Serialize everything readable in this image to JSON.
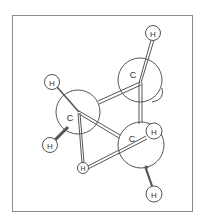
{
  "diagram": {
    "type": "ball-and-stick molecular model",
    "atoms": [
      {
        "id": "H1",
        "element": "H",
        "label": "H",
        "x": 153,
        "y": 33,
        "r": 7.5
      },
      {
        "id": "C1",
        "element": "C",
        "label": "C",
        "x": 140,
        "y": 80,
        "r": 22,
        "label_x": 133,
        "label_y": 77
      },
      {
        "id": "C2",
        "element": "C",
        "label": "C",
        "x": 78,
        "y": 112,
        "r": 22,
        "label_x": 70,
        "label_y": 121
      },
      {
        "id": "C3",
        "element": "C",
        "label": "C",
        "x": 141,
        "y": 145,
        "r": 23,
        "label_x": 132,
        "label_y": 141
      },
      {
        "id": "H2",
        "element": "H",
        "label": "H",
        "x": 52,
        "y": 82,
        "r": 7.5
      },
      {
        "id": "H3",
        "element": "H",
        "label": "H",
        "x": 50,
        "y": 145,
        "r": 7.5
      },
      {
        "id": "H4",
        "element": "H",
        "label": "H",
        "x": 83,
        "y": 168,
        "r": 5.5
      },
      {
        "id": "H5",
        "element": "H",
        "label": "H",
        "x": 154,
        "y": 131,
        "r": 8
      },
      {
        "id": "H6",
        "element": "H",
        "label": "H",
        "x": 154,
        "y": 194,
        "r": 8
      }
    ],
    "bonds": [
      {
        "from": "C1",
        "to": "H1"
      },
      {
        "from": "C1",
        "to": "C2"
      },
      {
        "from": "C1",
        "to": "C3"
      },
      {
        "from": "C2",
        "to": "C3"
      },
      {
        "from": "C2",
        "to": "H2"
      },
      {
        "from": "C2",
        "to": "H3"
      },
      {
        "from": "C2",
        "to": "H4"
      },
      {
        "from": "C3",
        "to": "H4"
      },
      {
        "from": "C3",
        "to": "H5"
      },
      {
        "from": "C3",
        "to": "H6"
      }
    ],
    "colors": {
      "frame": "#8a8a8a",
      "atom_stroke": "#555555",
      "bond": "#555555",
      "background": "#ffffff"
    }
  }
}
